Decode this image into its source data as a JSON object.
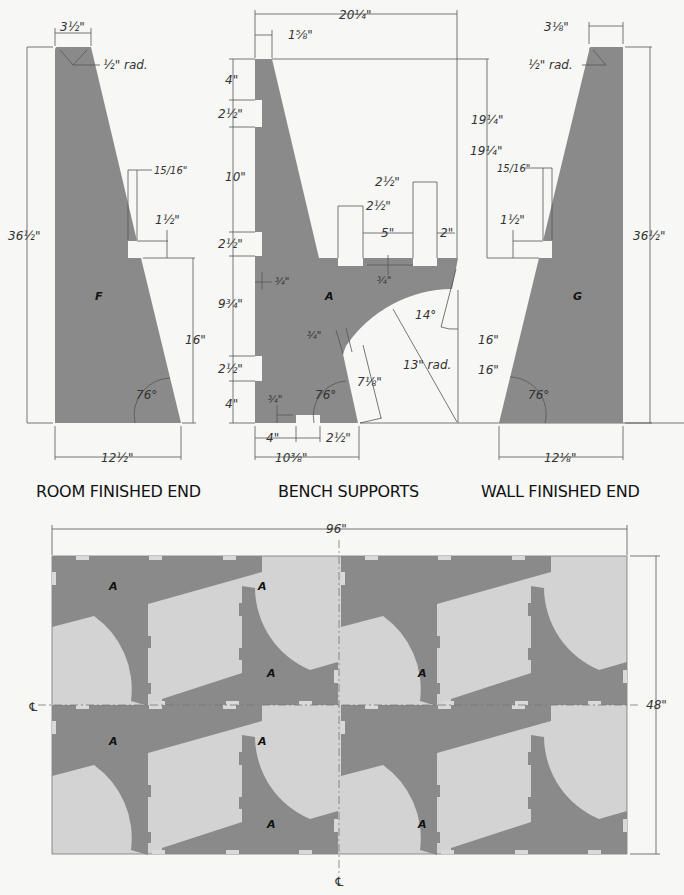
{
  "views": {
    "room_finished_end": {
      "title": "ROOM FINISHED END",
      "part_label": "F",
      "dims": {
        "top_width": "3½\"",
        "corner_radius": "½\" rad.",
        "height": "36½\"",
        "notch_depth": "15/16\"",
        "notch_height": "1½\"",
        "notch_elevation": "16\"",
        "angle": "76°",
        "base_width": "12½\""
      }
    },
    "bench_supports": {
      "title": "BENCH SUPPORTS",
      "part_label": "A",
      "dims": {
        "overall_width": "20¼\"",
        "top_width": "1⅝\"",
        "height_to_seat": "19¼\"",
        "left_4_top": "4\"",
        "left_slot_1": "2½\"",
        "left_10": "10\"",
        "left_slot_2": "2½\"",
        "left_9_3_4": "9¾\"",
        "left_slot_3": "2½\"",
        "left_4_bottom": "4\"",
        "slot_depth_left": "¾\"",
        "slot_a": "2½\"",
        "slot_b": "2½\"",
        "span_5": "5\"",
        "span_2": "2\"",
        "seat_slot_depth": "¾\"",
        "angle_14": "14°",
        "arc_radius": "13\" rad.",
        "edge_depth": "¾\"",
        "edge_len": "7⅛\"",
        "angle_76": "76°",
        "base_slot_depth": "¾\"",
        "height_16": "16\"",
        "base_4": "4\"",
        "base_slot": "2½\"",
        "base_width": "10⅜\""
      }
    },
    "wall_finished_end": {
      "title": "WALL FINISHED END",
      "part_label": "G",
      "dims": {
        "top_width": "3⅛\"",
        "corner_radius": "½\" rad.",
        "height": "36½\"",
        "height_19": "19¼\"",
        "notch_depth": "15/16\"",
        "notch_height": "1½\"",
        "notch_elevation": "16\"",
        "angle": "76°",
        "base_width": "12⅛\""
      }
    }
  },
  "cutting_layout": {
    "sheet_width": "96\"",
    "sheet_height": "48\"",
    "centerline_symbol": "℄",
    "part_labels": [
      "A",
      "A",
      "A",
      "A",
      "A",
      "A",
      "A",
      "A"
    ]
  },
  "colors": {
    "part": "#8a8a8a",
    "sheet": "#d3d3d3",
    "background": "#f7f7f5",
    "line": "#555555"
  }
}
